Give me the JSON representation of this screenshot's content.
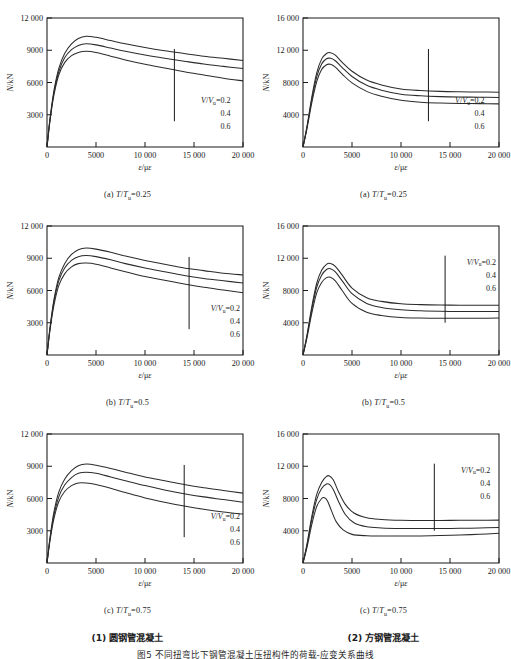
{
  "figure": {
    "caption": "图5  不同扭弯比下钢管混凝土压扭构件的荷载-应变关系曲线",
    "group_left_label": "(1) 圆钢管混凝土",
    "group_right_label": "(2) 方钢管混凝土"
  },
  "legend": {
    "series_label": "V/Vu=0.2",
    "series_prefix_italic_1": "V",
    "series_prefix_italic_2": "V",
    "series_sub": "u",
    "values": [
      "0.2",
      "0.4",
      "0.6"
    ],
    "line_1": "0.2",
    "line_2": "0.4",
    "line_3": "0.6"
  },
  "axes": {
    "xlabel": "ε/με",
    "ylabel": "N/kN",
    "xticks": [
      "0",
      "5000",
      "10 000",
      "15 000",
      "20 000"
    ],
    "yticks_left": [
      "3000",
      "6000",
      "9000",
      "12 000"
    ],
    "yticks_right": [
      "4000",
      "8000",
      "12 000",
      "16 000"
    ]
  },
  "chart_data": [
    {
      "type": "line",
      "id": "panel-1a",
      "title": "(a) T/Tu=0.25",
      "subcaption_prefix": "(a)",
      "subcaption_var": "T/Tu",
      "subcaption_value": "=0.25",
      "group": "圆钢管混凝土",
      "xlabel": "ε/με",
      "ylabel": "N/kN",
      "xlim": [
        0,
        20000
      ],
      "ylim": [
        0,
        12000
      ],
      "xticks": [
        0,
        5000,
        10000,
        15000,
        20000
      ],
      "yticks": [
        3000,
        6000,
        9000,
        12000
      ],
      "grid": false,
      "legend_position": "inside-lower-right",
      "annotation_leader_x": 13000,
      "series": [
        {
          "name": "V/Vu=0.2",
          "x": [
            0,
            300,
            700,
            1200,
            1800,
            2500,
            3200,
            4000,
            5000,
            6500,
            8000,
            10000,
            12000,
            14000,
            16000,
            18000,
            20000
          ],
          "values": [
            0,
            2600,
            5200,
            7300,
            8700,
            9600,
            10100,
            10300,
            10200,
            9900,
            9600,
            9250,
            8950,
            8700,
            8450,
            8250,
            8050
          ]
        },
        {
          "name": "V/Vu=0.4",
          "x": [
            0,
            300,
            700,
            1200,
            1800,
            2500,
            3200,
            4000,
            5000,
            6500,
            8000,
            10000,
            12000,
            14000,
            16000,
            18000,
            20000
          ],
          "values": [
            0,
            2500,
            5000,
            7000,
            8300,
            9050,
            9450,
            9600,
            9500,
            9200,
            8900,
            8550,
            8250,
            7980,
            7720,
            7500,
            7300
          ]
        },
        {
          "name": "V/Vu=0.6",
          "x": [
            0,
            300,
            700,
            1200,
            1800,
            2500,
            3200,
            4000,
            5000,
            6500,
            8000,
            10000,
            12000,
            14000,
            16000,
            18000,
            20000
          ],
          "values": [
            0,
            2400,
            4800,
            6700,
            7850,
            8500,
            8800,
            8900,
            8800,
            8450,
            8100,
            7700,
            7350,
            7000,
            6700,
            6400,
            6150
          ]
        }
      ]
    },
    {
      "type": "line",
      "id": "panel-1b",
      "title": "(b) T/Tu=0.5",
      "subcaption_prefix": "(b)",
      "subcaption_var": "T/Tu",
      "subcaption_value": "=0.5",
      "group": "圆钢管混凝土",
      "xlabel": "ε/με",
      "ylabel": "N/kN",
      "xlim": [
        0,
        20000
      ],
      "ylim": [
        0,
        12000
      ],
      "xticks": [
        0,
        5000,
        10000,
        15000,
        20000
      ],
      "yticks": [
        3000,
        6000,
        9000,
        12000
      ],
      "grid": false,
      "legend_position": "inside-lower-right",
      "annotation_leader_x": 14500,
      "series": [
        {
          "name": "V/Vu=0.2",
          "x": [
            0,
            300,
            700,
            1200,
            1800,
            2500,
            3200,
            4000,
            5000,
            6500,
            8000,
            10000,
            12000,
            14000,
            16000,
            18000,
            20000
          ],
          "values": [
            0,
            2500,
            5100,
            7200,
            8500,
            9350,
            9800,
            9950,
            9850,
            9550,
            9200,
            8800,
            8450,
            8100,
            7850,
            7600,
            7450
          ]
        },
        {
          "name": "V/Vu=0.4",
          "x": [
            0,
            300,
            700,
            1200,
            1800,
            2500,
            3200,
            4000,
            5000,
            6500,
            8000,
            10000,
            12000,
            14000,
            16000,
            18000,
            20000
          ],
          "values": [
            0,
            2400,
            4900,
            6900,
            8100,
            8800,
            9150,
            9250,
            9150,
            8850,
            8500,
            8100,
            7750,
            7400,
            7120,
            6900,
            6700
          ]
        },
        {
          "name": "V/Vu=0.6",
          "x": [
            0,
            300,
            700,
            1200,
            1800,
            2500,
            3200,
            4000,
            5000,
            6500,
            8000,
            10000,
            12000,
            14000,
            16000,
            18000,
            20000
          ],
          "values": [
            0,
            2300,
            4600,
            6450,
            7550,
            8200,
            8500,
            8550,
            8450,
            8100,
            7750,
            7300,
            6950,
            6600,
            6300,
            6050,
            5800
          ]
        }
      ]
    },
    {
      "type": "line",
      "id": "panel-1c",
      "title": "(c) T/Tu=0.75",
      "subcaption_prefix": "(c)",
      "subcaption_var": "T/Tu",
      "subcaption_value": "=0.75",
      "group": "圆钢管混凝土",
      "xlabel": "ε/με",
      "ylabel": "N/kN",
      "xlim": [
        0,
        20000
      ],
      "ylim": [
        0,
        12000
      ],
      "xticks": [
        0,
        5000,
        10000,
        15000,
        20000
      ],
      "yticks": [
        3000,
        6000,
        9000,
        12000
      ],
      "grid": false,
      "legend_position": "inside-lower-right",
      "annotation_leader_x": 14000,
      "series": [
        {
          "name": "V/Vu=0.2",
          "x": [
            0,
            300,
            700,
            1200,
            1800,
            2500,
            3200,
            4000,
            5000,
            6500,
            8000,
            10000,
            12000,
            14000,
            16000,
            18000,
            20000
          ],
          "values": [
            0,
            2300,
            4700,
            6600,
            7800,
            8600,
            9050,
            9200,
            9100,
            8800,
            8450,
            8000,
            7650,
            7300,
            7000,
            6750,
            6500
          ]
        },
        {
          "name": "V/Vu=0.4",
          "x": [
            0,
            300,
            700,
            1200,
            1800,
            2500,
            3200,
            4000,
            5000,
            6500,
            8000,
            10000,
            12000,
            14000,
            16000,
            18000,
            20000
          ],
          "values": [
            0,
            2200,
            4400,
            6150,
            7250,
            7950,
            8350,
            8450,
            8350,
            8000,
            7650,
            7200,
            6800,
            6450,
            6150,
            5900,
            5650
          ]
        },
        {
          "name": "V/Vu=0.6",
          "x": [
            0,
            300,
            700,
            1200,
            1800,
            2500,
            3200,
            4000,
            5000,
            6500,
            8000,
            10000,
            12000,
            14000,
            16000,
            18000,
            20000
          ],
          "values": [
            0,
            2050,
            4100,
            5700,
            6650,
            7200,
            7450,
            7450,
            7300,
            6950,
            6550,
            6050,
            5650,
            5300,
            5000,
            4750,
            4550
          ]
        }
      ]
    },
    {
      "type": "line",
      "id": "panel-2a",
      "title": "(a) T/Tu=0.25",
      "subcaption_prefix": "(a)",
      "subcaption_var": "T/Tu",
      "subcaption_value": "=0.25",
      "group": "方钢管混凝土",
      "xlabel": "ε/με",
      "ylabel": "N/kN",
      "xlim": [
        0,
        20000
      ],
      "ylim": [
        0,
        16000
      ],
      "xticks": [
        0,
        5000,
        10000,
        15000,
        20000
      ],
      "yticks": [
        4000,
        8000,
        12000,
        16000
      ],
      "grid": false,
      "legend_position": "inside-lower-right",
      "annotation_leader_x": 12800,
      "series": [
        {
          "name": "V/Vu=0.2",
          "x": [
            0,
            400,
            900,
            1400,
            1900,
            2400,
            2800,
            3300,
            4000,
            5000,
            6500,
            8000,
            10000,
            12000,
            14000,
            16000,
            18000,
            20000
          ],
          "values": [
            0,
            2500,
            6200,
            9200,
            10900,
            11600,
            11700,
            11400,
            10500,
            9400,
            8300,
            7700,
            7200,
            7000,
            6900,
            6850,
            6820,
            6800
          ]
        },
        {
          "name": "V/Vu=0.4",
          "x": [
            0,
            400,
            900,
            1400,
            1900,
            2400,
            2800,
            3300,
            4000,
            5000,
            6500,
            8000,
            10000,
            12000,
            14000,
            16000,
            18000,
            20000
          ],
          "values": [
            0,
            2400,
            5900,
            8700,
            10300,
            10950,
            11000,
            10700,
            9850,
            8750,
            7650,
            7050,
            6550,
            6350,
            6250,
            6200,
            6180,
            6150
          ]
        },
        {
          "name": "V/Vu=0.6",
          "x": [
            0,
            400,
            900,
            1400,
            1900,
            2400,
            2800,
            3300,
            4000,
            5000,
            6500,
            8000,
            10000,
            12000,
            14000,
            16000,
            18000,
            20000
          ],
          "values": [
            0,
            2250,
            5500,
            8100,
            9600,
            10200,
            10250,
            9900,
            9050,
            7950,
            6900,
            6300,
            5800,
            5550,
            5450,
            5400,
            5380,
            5350
          ]
        }
      ]
    },
    {
      "type": "line",
      "id": "panel-2b",
      "title": "(b) T/Tu=0.5",
      "subcaption_prefix": "(b)",
      "subcaption_var": "T/Tu",
      "subcaption_value": "=0.5",
      "group": "方钢管混凝土",
      "xlabel": "ε/με",
      "ylabel": "N/kN",
      "xlim": [
        0,
        20000
      ],
      "ylim": [
        0,
        16000
      ],
      "xticks": [
        0,
        5000,
        10000,
        15000,
        20000
      ],
      "yticks": [
        4000,
        8000,
        12000,
        16000
      ],
      "grid": false,
      "legend_position": "inside-upper-right",
      "annotation_leader_x": 14500,
      "series": [
        {
          "name": "V/Vu=0.2",
          "x": [
            0,
            400,
            900,
            1400,
            1900,
            2400,
            2800,
            3300,
            4000,
            5000,
            6500,
            8000,
            10000,
            12000,
            14000,
            16000,
            18000,
            20000
          ],
          "values": [
            0,
            2400,
            6000,
            8900,
            10500,
            11250,
            11350,
            11000,
            9900,
            8300,
            7100,
            6650,
            6350,
            6250,
            6200,
            6180,
            6170,
            6180
          ]
        },
        {
          "name": "V/Vu=0.4",
          "x": [
            0,
            400,
            900,
            1400,
            1900,
            2400,
            2800,
            3300,
            4000,
            5000,
            6500,
            8000,
            10000,
            12000,
            14000,
            16000,
            18000,
            20000
          ],
          "values": [
            0,
            2300,
            5700,
            8400,
            9900,
            10600,
            10700,
            10300,
            9200,
            7600,
            6400,
            5900,
            5600,
            5480,
            5420,
            5400,
            5400,
            5400
          ]
        },
        {
          "name": "V/Vu=0.6",
          "x": [
            0,
            400,
            900,
            1400,
            1900,
            2400,
            2800,
            3300,
            4000,
            5000,
            6500,
            8000,
            10000,
            12000,
            14000,
            16000,
            18000,
            20000
          ],
          "values": [
            0,
            2100,
            5200,
            7700,
            9000,
            9600,
            9650,
            9200,
            8000,
            6400,
            5300,
            4900,
            4650,
            4580,
            4550,
            4550,
            4560,
            4580
          ]
        }
      ]
    },
    {
      "type": "line",
      "id": "panel-2c",
      "title": "(c) T/Tu=0.75",
      "subcaption_prefix": "(c)",
      "subcaption_var": "T/Tu",
      "subcaption_value": "=0.75",
      "group": "方钢管混凝土",
      "xlabel": "ε/με",
      "ylabel": "N/kN",
      "xlim": [
        0,
        20000
      ],
      "ylim": [
        0,
        16000
      ],
      "xticks": [
        0,
        5000,
        10000,
        15000,
        20000
      ],
      "yticks": [
        4000,
        8000,
        12000,
        16000
      ],
      "grid": false,
      "legend_position": "inside-upper-right",
      "annotation_leader_x": 13400,
      "series": [
        {
          "name": "V/Vu=0.2",
          "x": [
            0,
            400,
            900,
            1400,
            1900,
            2400,
            2700,
            3100,
            3600,
            4300,
            5200,
            6500,
            8000,
            10000,
            12000,
            14000,
            16000,
            18000,
            20000
          ],
          "values": [
            0,
            2300,
            5800,
            8500,
            10000,
            10750,
            10800,
            10300,
            8900,
            7300,
            6200,
            5600,
            5400,
            5300,
            5280,
            5280,
            5290,
            5300,
            5320
          ]
        },
        {
          "name": "V/Vu=0.4",
          "x": [
            0,
            400,
            900,
            1400,
            1900,
            2400,
            2700,
            3100,
            3600,
            4300,
            5200,
            6500,
            8000,
            10000,
            12000,
            14000,
            16000,
            18000,
            20000
          ],
          "values": [
            0,
            2150,
            5400,
            7900,
            9250,
            9800,
            9750,
            9100,
            7700,
            6050,
            5000,
            4500,
            4350,
            4280,
            4270,
            4280,
            4300,
            4340,
            4400
          ]
        },
        {
          "name": "V/Vu=0.6",
          "x": [
            0,
            400,
            900,
            1400,
            1900,
            2200,
            2500,
            2900,
            3400,
            4100,
            5000,
            6500,
            8000,
            10000,
            12000,
            14000,
            16000,
            18000,
            20000
          ],
          "values": [
            0,
            1900,
            4800,
            7000,
            8000,
            8100,
            7700,
            6500,
            5100,
            4100,
            3550,
            3380,
            3350,
            3350,
            3360,
            3400,
            3470,
            3560,
            3680
          ]
        }
      ]
    }
  ]
}
